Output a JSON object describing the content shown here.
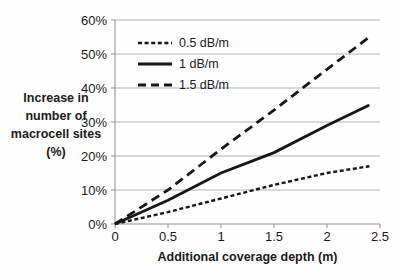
{
  "chart_data": {
    "type": "line",
    "title": "",
    "xlabel": "Additional coverage depth (m)",
    "ylabel": "Increase in number of macrocell sites (%)",
    "ylabel_lines": [
      "Increase in",
      "number of",
      "macrocell sites",
      "(%)"
    ],
    "x": [
      0,
      0.5,
      1,
      1.5,
      2,
      2.4
    ],
    "series": [
      {
        "name": "0.5 dB/m",
        "style": "short-dash",
        "values": [
          0,
          3.5,
          7.5,
          11.5,
          15,
          17
        ]
      },
      {
        "name": "1 dB/m",
        "style": "solid",
        "values": [
          0,
          7,
          15,
          21,
          29,
          35
        ]
      },
      {
        "name": "1.5 dB/m",
        "style": "long-dash",
        "values": [
          0,
          10,
          22,
          33.5,
          45.5,
          55
        ]
      }
    ],
    "x_ticks": [
      "0",
      "0.5",
      "1",
      "1.5",
      "2",
      "2.5"
    ],
    "x_tick_values": [
      0,
      0.5,
      1,
      1.5,
      2,
      2.5
    ],
    "y_ticks": [
      "0%",
      "10%",
      "20%",
      "30%",
      "40%",
      "50%",
      "60%"
    ],
    "y_tick_values": [
      0,
      10,
      20,
      30,
      40,
      50,
      60
    ],
    "xlim": [
      0,
      2.5
    ],
    "ylim": [
      0,
      60
    ],
    "grid": "horizontal",
    "legend_position": "top-left-inside",
    "colors": {
      "line": "#161616",
      "grid": "#b2b2b2",
      "axis": "#8f8f8f",
      "text": "#1a1a1a",
      "background": "#ffffff"
    }
  }
}
